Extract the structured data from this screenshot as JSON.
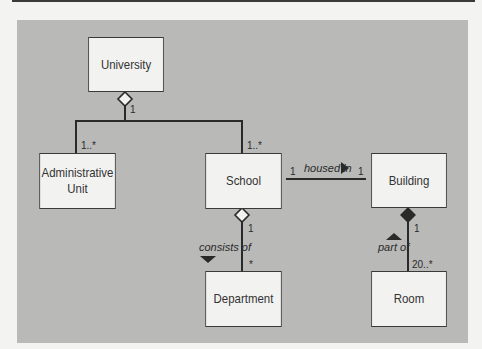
{
  "diagram": {
    "type": "UML class diagram",
    "classes": {
      "university": "University",
      "admin_line1": "Administrative",
      "admin_line2": "Unit",
      "school": "School",
      "building": "Building",
      "department": "Department",
      "room": "Room"
    },
    "associations": {
      "univ_agg_mult": "1",
      "admin_mult": "1..*",
      "school_univ_mult": "1..*",
      "housed_in": "housed in",
      "housed_school_mult": "1",
      "housed_building_mult": "1",
      "consists_of": "consists of",
      "school_agg_mult": "1",
      "dept_mult": "*",
      "part_of": "part of",
      "building_comp_mult": "1",
      "room_mult": "20..*"
    },
    "colors": {
      "panel": "#b9b9b7",
      "box_fill": "#f2f2f0",
      "line": "#2a2a2a",
      "page": "#f3f3f1"
    }
  }
}
